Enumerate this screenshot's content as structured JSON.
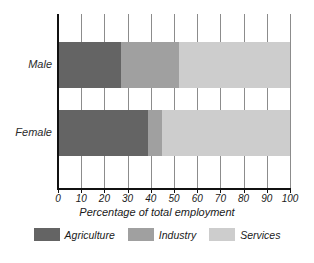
{
  "chart_data": {
    "type": "bar",
    "orientation": "horizontal",
    "stacked": true,
    "title": "",
    "xlabel": "Percentage of total employment",
    "ylabel": "",
    "xlim": [
      0,
      100
    ],
    "xticks": [
      0,
      10,
      20,
      30,
      40,
      50,
      60,
      70,
      80,
      90,
      100
    ],
    "xtick_labels": [
      "0",
      "10",
      "20",
      "30",
      "40",
      "50",
      "60",
      "70",
      "80",
      "90",
      "100"
    ],
    "categories": [
      "Male",
      "Female"
    ],
    "grid": true,
    "legend_position": "bottom",
    "series": [
      {
        "name": "Agriculture",
        "color": "#646464",
        "values": [
          27,
          39
        ]
      },
      {
        "name": "Industry",
        "color": "#a0a0a0",
        "values": [
          25,
          6
        ]
      },
      {
        "name": "Services",
        "color": "#cdcdcd",
        "values": [
          48,
          55
        ]
      }
    ],
    "segment_boundaries": {
      "Male": {
        "agriculture_end": 27,
        "industry_end": 52,
        "services_end": 100
      },
      "Female": {
        "agriculture_end": 39,
        "industry_end": 45,
        "services_end": 100
      }
    }
  },
  "legend": {
    "items": [
      {
        "label": "Agriculture"
      },
      {
        "label": "Industry"
      },
      {
        "label": "Services"
      }
    ]
  },
  "axis": {
    "title": "Percentage of total employment"
  },
  "colors": {
    "agriculture": "#646464",
    "industry": "#a0a0a0",
    "services": "#cdcdcd",
    "axis": "#111111",
    "gridline": "#8c8c8c",
    "background": "#ffffff"
  }
}
